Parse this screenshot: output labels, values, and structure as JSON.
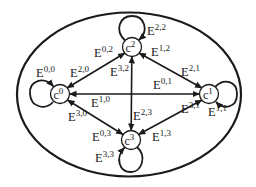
{
  "diagram": {
    "type": "state-transition-graph",
    "background": "#ffffff",
    "stroke_color": "#1a1a1a",
    "boundary": {
      "shape": "ellipse",
      "cx": 129,
      "cy": 94.5,
      "rx": 112,
      "ry": 82
    },
    "nodes": [
      {
        "id": "c0",
        "base": "c",
        "sup": "0",
        "cx": 60,
        "cy": 94,
        "r": 9
      },
      {
        "id": "c1",
        "base": "c",
        "sup": "1",
        "cx": 209,
        "cy": 94,
        "r": 9
      },
      {
        "id": "c2",
        "base": "c",
        "sup": "2",
        "cx": 132,
        "cy": 47,
        "r": 9
      },
      {
        "id": "c3",
        "base": "c",
        "sup": "3",
        "cx": 131,
        "cy": 140,
        "r": 9
      }
    ],
    "self_loops": [
      {
        "node": "c0",
        "label_base": "E",
        "label_sup": "0,0"
      },
      {
        "node": "c1",
        "label_base": "E",
        "label_sup": "1,1"
      },
      {
        "node": "c2",
        "label_base": "E",
        "label_sup": "2,2"
      },
      {
        "node": "c3",
        "label_base": "E",
        "label_sup": "3,3"
      }
    ],
    "edges": [
      {
        "from": "c0",
        "to": "c2",
        "label_base": "E",
        "label_sup": "0,2"
      },
      {
        "from": "c2",
        "to": "c0",
        "label_base": "E",
        "label_sup": "2,0"
      },
      {
        "from": "c0",
        "to": "c1",
        "label_base": "E",
        "label_sup": "0,1"
      },
      {
        "from": "c1",
        "to": "c0",
        "label_base": "E",
        "label_sup": "1,0"
      },
      {
        "from": "c0",
        "to": "c3",
        "label_base": "E",
        "label_sup": "0,3"
      },
      {
        "from": "c3",
        "to": "c0",
        "label_base": "E",
        "label_sup": "3,0"
      },
      {
        "from": "c1",
        "to": "c2",
        "label_base": "E",
        "label_sup": "1,2"
      },
      {
        "from": "c2",
        "to": "c1",
        "label_base": "E",
        "label_sup": "2,1"
      },
      {
        "from": "c1",
        "to": "c3",
        "label_base": "E",
        "label_sup": "1,3"
      },
      {
        "from": "c3",
        "to": "c1",
        "label_base": "E",
        "label_sup": "3,1"
      },
      {
        "from": "c2",
        "to": "c3",
        "label_base": "E",
        "label_sup": "2,3"
      },
      {
        "from": "c3",
        "to": "c2",
        "label_base": "E",
        "label_sup": "3,2"
      }
    ]
  },
  "labels": {
    "c0": {
      "base": "c",
      "sup": "0"
    },
    "c1": {
      "base": "c",
      "sup": "1"
    },
    "c2": {
      "base": "c",
      "sup": "2"
    },
    "c3": {
      "base": "c",
      "sup": "3"
    },
    "E00": {
      "base": "E",
      "sup": "0,0"
    },
    "E11": {
      "base": "E",
      "sup": "1,1"
    },
    "E22": {
      "base": "E",
      "sup": "2,2"
    },
    "E33": {
      "base": "E",
      "sup": "3,3"
    },
    "E02": {
      "base": "E",
      "sup": "0,2"
    },
    "E20": {
      "base": "E",
      "sup": "2,0"
    },
    "E01": {
      "base": "E",
      "sup": "0,1"
    },
    "E10": {
      "base": "E",
      "sup": "1,0"
    },
    "E03": {
      "base": "E",
      "sup": "0,3"
    },
    "E30": {
      "base": "E",
      "sup": "3,0"
    },
    "E12": {
      "base": "E",
      "sup": "1,2"
    },
    "E21": {
      "base": "E",
      "sup": "2,1"
    },
    "E13": {
      "base": "E",
      "sup": "1,3"
    },
    "E31": {
      "base": "E",
      "sup": "3,1"
    },
    "E23": {
      "base": "E",
      "sup": "2,3"
    },
    "E32": {
      "base": "E",
      "sup": "3,2"
    }
  }
}
